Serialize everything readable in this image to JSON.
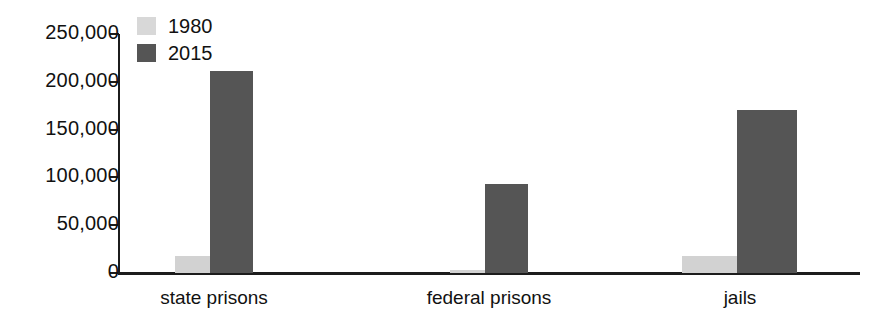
{
  "chart_data": {
    "type": "bar",
    "title": "",
    "subtitle": "",
    "xlabel": "",
    "ylabel": "",
    "categories": [
      "state prisons",
      "federal prisons",
      "jails"
    ],
    "series": [
      {
        "name": "1980",
        "color": "#d2d2d2",
        "values": [
          17800,
          3000,
          17500
        ]
      },
      {
        "name": "2015",
        "color": "#555555",
        "values": [
          211300,
          93000,
          170500
        ]
      }
    ],
    "ylim": [
      0,
      250000
    ],
    "ytick_values": [
      0,
      50000,
      100000,
      150000,
      200000,
      250000
    ],
    "ytick_labels": [
      "0",
      "50,000",
      "100,000",
      "150,000",
      "200,000",
      "250,000"
    ],
    "grid": false,
    "legend_position": "top-left",
    "legend_entries": [
      "1980",
      "2015"
    ]
  }
}
